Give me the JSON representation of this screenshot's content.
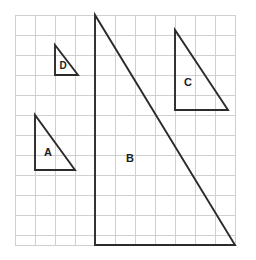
{
  "figure": {
    "background_color": "#ffffff",
    "width": 256,
    "height": 260
  },
  "grid": {
    "line_color": "#cfcfd4",
    "cell_size": 20,
    "left": 15,
    "top": 15,
    "right": 235,
    "bottom": 245,
    "columns": 11,
    "rows": 11.5,
    "x_lines": [
      15,
      35,
      55,
      75,
      95,
      115,
      135,
      155,
      175,
      195,
      215,
      235
    ],
    "y_lines": [
      15,
      35,
      55,
      75,
      95,
      115,
      135,
      155,
      175,
      195,
      215,
      235,
      245
    ]
  },
  "style": {
    "triangle_stroke_color": "#2b2b2b",
    "triangle_stroke_width": 1.9,
    "label_color": "#1d1d1d"
  },
  "chart_data": {
    "type": "diagram",
    "grid_cell_size_px": 20,
    "shapes": [
      {
        "label": "A",
        "type": "right-triangle",
        "points_px": [
          [
            35,
            115
          ],
          [
            35,
            170
          ],
          [
            75,
            170
          ]
        ],
        "polygon_points": "35,115 35,170 75,170",
        "right_angle_at_px": [
          35,
          170
        ],
        "legs_cells": {
          "vertical": 2.75,
          "horizontal": 2.0
        },
        "label_position_px": [
          48,
          153
        ]
      },
      {
        "label": "B",
        "type": "right-triangle",
        "points_px": [
          [
            95,
            15
          ],
          [
            95,
            245
          ],
          [
            235,
            245
          ]
        ],
        "polygon_points": "95,15 95,245 235,245",
        "right_angle_at_px": [
          95,
          245
        ],
        "legs_cells": {
          "vertical": 11.5,
          "horizontal": 7.0
        },
        "label_position_px": [
          130,
          159
        ]
      },
      {
        "label": "C",
        "type": "right-triangle",
        "points_px": [
          [
            175,
            30
          ],
          [
            175,
            110
          ],
          [
            228,
            110
          ]
        ],
        "polygon_points": "175,30 175,110 228,110",
        "right_angle_at_px": [
          175,
          110
        ],
        "legs_cells": {
          "vertical": 4.0,
          "horizontal": 2.65
        },
        "label_position_px": [
          188,
          83
        ]
      },
      {
        "label": "D",
        "type": "right-triangle",
        "points_px": [
          [
            55,
            45
          ],
          [
            55,
            75
          ],
          [
            78,
            75
          ]
        ],
        "polygon_points": "55,45 55,75 78,75",
        "right_angle_at_px": [
          55,
          75
        ],
        "legs_cells": {
          "vertical": 1.5,
          "horizontal": 1.15
        },
        "label_position_px": [
          63,
          66
        ]
      }
    ]
  },
  "labels": {
    "a": "A",
    "b": "B",
    "c": "C",
    "d": "D"
  }
}
